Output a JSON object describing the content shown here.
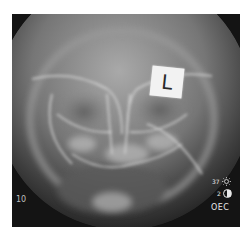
{
  "image": {
    "type": "radiograph",
    "description": "Frontal (PA) skull X-ray of a child, facial bones and orbits visible"
  },
  "marker": {
    "label": "L"
  },
  "overlay": {
    "frame_number": "10",
    "brightness": {
      "value": "37",
      "icon": "sun-icon"
    },
    "contrast": {
      "value": "2",
      "icon": "contrast-icon"
    },
    "brand": "OEC"
  },
  "colors": {
    "background": "#141414",
    "bone": "#cfcfcf",
    "text": "#e5e5e5",
    "page": "#ffffff"
  }
}
